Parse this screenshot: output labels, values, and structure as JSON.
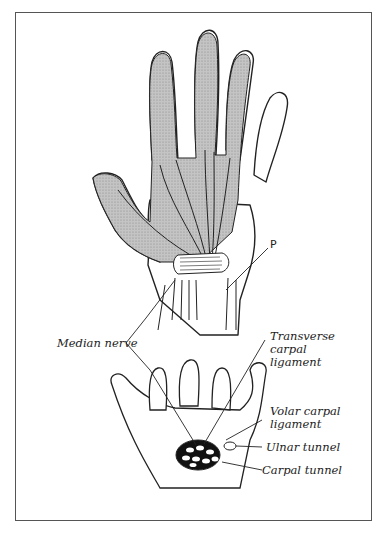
{
  "figure": {
    "labels": {
      "p": "P",
      "median_nerve": "Median nerve",
      "transverse_carpal_ligament": [
        "Transverse",
        "carpal",
        "ligament"
      ],
      "volar_carpal_ligament": [
        "Volar carpal",
        "ligament"
      ],
      "ulnar_tunnel": "Ulnar tunnel",
      "carpal_tunnel": "Carpal tunnel"
    },
    "colors": {
      "shading": "#b9b9b9",
      "ink": "#222222",
      "frame": "#555555"
    }
  }
}
